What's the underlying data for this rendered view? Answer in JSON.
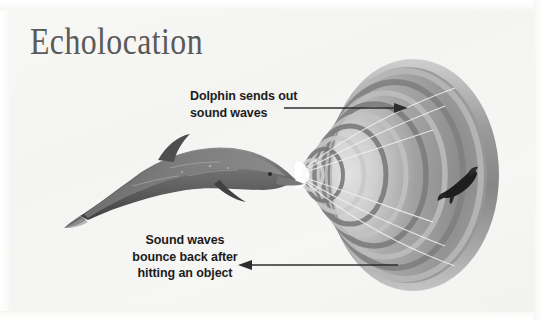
{
  "figure": {
    "title": "Echolocation",
    "kind": "echolocation-diagram",
    "background_color": "#f5f5f3",
    "text_color": "#1c1c1c",
    "title_color": "#5a5a58"
  },
  "labels": {
    "top": {
      "line1": "Dolphin sends out",
      "line2": "sound waves",
      "text": "Dolphin sends out\nsound waves",
      "arrow_direction": "right"
    },
    "bottom": {
      "line1": "Sound waves",
      "line2": "bounce back after",
      "line3": "hitting an object",
      "text": "Sound waves\nbounce back after\nhitting an object",
      "arrow_direction": "left"
    }
  },
  "illustration": {
    "dolphin": {
      "name": "dolphin",
      "facing": "right",
      "body_color": "#6f6f6f",
      "shadow_color": "#4a4a4a"
    },
    "sound_cone": {
      "name": "sound-wave-cone",
      "ring_count": 9,
      "apex_color": "#ffffff",
      "ring_dark": "#7e7e7e",
      "ring_light": "#c9c9c9",
      "direction": "widening-right"
    },
    "fish": {
      "name": "fish-target",
      "color": "#1e1e1e"
    },
    "arrow_color": "#2e2e2e"
  }
}
